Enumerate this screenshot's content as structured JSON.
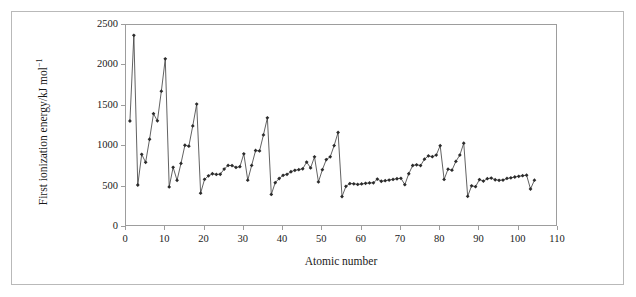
{
  "figure": {
    "background_color": "#ffffff",
    "border_color": "#b9b9b9",
    "axis_color": "#9d9d9d",
    "series_color": "#2b2b2b"
  },
  "chart_data": {
    "type": "line",
    "title": "",
    "xlabel": "Atomic number",
    "ylabel_text": "First ionization energy/kJ mol",
    "ylabel_exponent": "−1",
    "xlim": [
      0,
      110
    ],
    "ylim": [
      0,
      2500
    ],
    "xticks": [
      0,
      10,
      20,
      30,
      40,
      50,
      60,
      70,
      80,
      90,
      100,
      110
    ],
    "yticks": [
      0,
      500,
      1000,
      1500,
      2000,
      2500
    ],
    "grid": false,
    "legend": "none",
    "marker": "diamond",
    "series": [
      {
        "name": "First ionization energy",
        "x": [
          1,
          2,
          3,
          4,
          5,
          6,
          7,
          8,
          9,
          10,
          11,
          12,
          13,
          14,
          15,
          16,
          17,
          18,
          19,
          20,
          21,
          22,
          23,
          24,
          25,
          26,
          27,
          28,
          29,
          30,
          31,
          32,
          33,
          34,
          35,
          36,
          37,
          38,
          39,
          40,
          41,
          42,
          43,
          44,
          45,
          46,
          47,
          48,
          49,
          50,
          51,
          52,
          53,
          54,
          55,
          56,
          57,
          58,
          59,
          60,
          61,
          62,
          63,
          64,
          65,
          66,
          67,
          68,
          69,
          70,
          71,
          72,
          73,
          74,
          75,
          76,
          77,
          78,
          79,
          80,
          81,
          82,
          83,
          84,
          85,
          86,
          87,
          88,
          89,
          90,
          91,
          92,
          93,
          94,
          95,
          96,
          97,
          98,
          99,
          100,
          101,
          102,
          103,
          104
        ],
        "values": [
          1312,
          2372,
          520,
          899,
          801,
          1086,
          1402,
          1314,
          1681,
          2081,
          496,
          738,
          578,
          787,
          1012,
          1000,
          1251,
          1521,
          419,
          590,
          633,
          659,
          651,
          653,
          717,
          762,
          760,
          737,
          746,
          906,
          579,
          762,
          947,
          941,
          1140,
          1351,
          403,
          549,
          600,
          640,
          652,
          684,
          702,
          710,
          720,
          804,
          731,
          868,
          558,
          709,
          834,
          869,
          1008,
          1170,
          376,
          503,
          538,
          534,
          527,
          533,
          540,
          545,
          547,
          593,
          566,
          573,
          581,
          589,
          597,
          603,
          524,
          659,
          761,
          770,
          760,
          840,
          880,
          870,
          890,
          1007,
          589,
          716,
          703,
          812,
          890,
          1037,
          380,
          509,
          499,
          587,
          568,
          598,
          605,
          585,
          578,
          581,
          601,
          608,
          619,
          627,
          635,
          642,
          470,
          580
        ]
      }
    ]
  }
}
